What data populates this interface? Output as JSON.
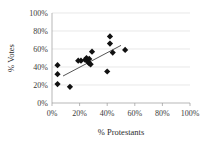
{
  "chart_data": {
    "type": "scatter",
    "title": "",
    "xlabel": "% Protestants",
    "ylabel": "% Votes",
    "xlim": [
      0,
      100
    ],
    "ylim": [
      0,
      100
    ],
    "grid": true,
    "grid_axis": "y",
    "legend": "none",
    "xticks": [
      "0%",
      "20%",
      "40%",
      "60%",
      "80%",
      "100%"
    ],
    "xtick_values": [
      0,
      20,
      40,
      60,
      80,
      100
    ],
    "yticks": [
      "0%",
      "20%",
      "40%",
      "60%",
      "80%",
      "100%"
    ],
    "ytick_values": [
      0,
      20,
      40,
      60,
      80,
      100
    ],
    "marker_style": "filled-diamond",
    "marker_color": "#111111",
    "series": [
      {
        "name": "observations",
        "points": [
          [
            4,
            42
          ],
          [
            4,
            32
          ],
          [
            4,
            21
          ],
          [
            13,
            18
          ],
          [
            19,
            47
          ],
          [
            21,
            47
          ],
          [
            24,
            48
          ],
          [
            25,
            50
          ],
          [
            26,
            46
          ],
          [
            27,
            49
          ],
          [
            27,
            44
          ],
          [
            28,
            43
          ],
          [
            29,
            57
          ],
          [
            40,
            35
          ],
          [
            42,
            74
          ],
          [
            42,
            66
          ],
          [
            44,
            56
          ],
          [
            53,
            59
          ]
        ]
      }
    ],
    "trendline": {
      "type": "linear",
      "x0": 8,
      "y0": 30,
      "x1": 50,
      "y1": 64,
      "color": "#2a2a2a"
    }
  }
}
